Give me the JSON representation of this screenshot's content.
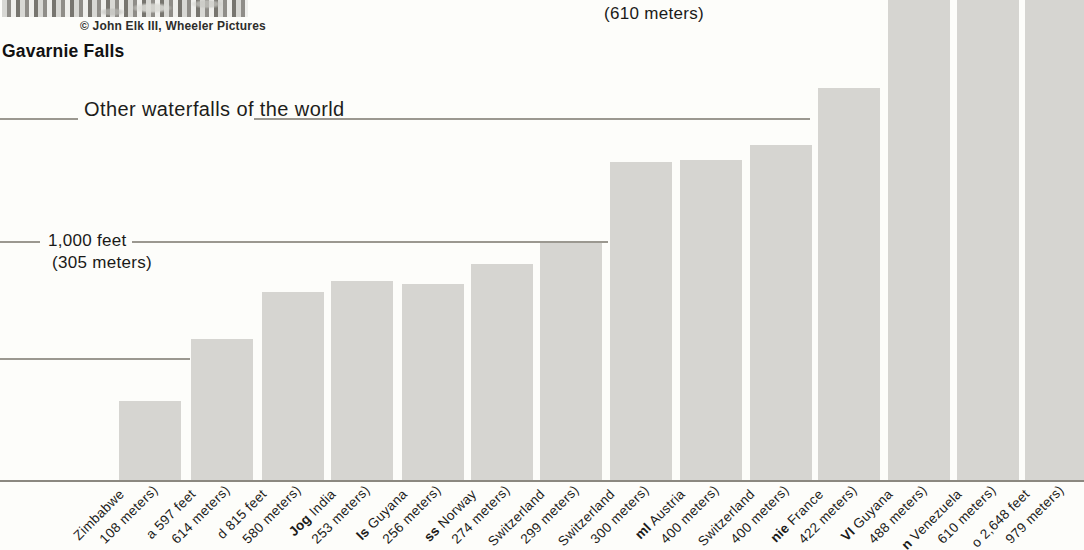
{
  "photo": {
    "caption": "© John Elk III, Wheeler Pictures",
    "title": "Gavarnie Falls"
  },
  "header": {
    "label": "Other waterfalls of the world"
  },
  "axis": {
    "gridline_2000ft_meters_label": "(610 meters)",
    "gridline_1000ft_feet_label": "1,000 feet",
    "gridline_1000ft_meters_label": "(305 meters)"
  },
  "colors": {
    "bar_fill": "#d6d5d1",
    "grid_line": "#9b9890",
    "baseline": "#8b8880",
    "text": "#1b1b19",
    "background": "#fdfdfa"
  },
  "geometry": {
    "baseline_y": 480,
    "gridline_1000ft_y": 241,
    "gridline_500ft_y": 358,
    "header_rule_y": 118,
    "bar_width": 62,
    "label1_dx": 8,
    "label1_y": 497,
    "label2_dx": 42,
    "label2_y": 493
  },
  "bars": [
    {
      "left": 119,
      "top": 401,
      "name_bold": "",
      "name_frag": "Zimbabwe",
      "meters_frag": "108 meters)"
    },
    {
      "left": 191,
      "top": 339,
      "name_bold": "",
      "name_frag": "a 597 feet",
      "meters_frag": "614 meters)"
    },
    {
      "left": 262,
      "top": 292,
      "name_bold": "",
      "name_frag": "d 815 feet",
      "meters_frag": "580 meters)"
    },
    {
      "left": 331,
      "top": 281,
      "name_bold": "Jog",
      "name_frag": " India",
      "meters_frag": "253 meters)"
    },
    {
      "left": 402,
      "top": 284,
      "name_bold": "ls",
      "name_frag": " Guyana",
      "meters_frag": "256 meters)"
    },
    {
      "left": 471,
      "top": 264,
      "name_bold": "ss",
      "name_frag": " Norway",
      "meters_frag": "274 meters)"
    },
    {
      "left": 540,
      "top": 242,
      "name_bold": "",
      "name_frag": "Switzerland",
      "meters_frag": "299 meters)"
    },
    {
      "left": 610,
      "top": 162,
      "name_bold": "",
      "name_frag": "Switzerland",
      "meters_frag": "300 meters)"
    },
    {
      "left": 680,
      "top": 160,
      "name_bold": "ml",
      "name_frag": " Austria",
      "meters_frag": "400 meters)"
    },
    {
      "left": 750,
      "top": 145,
      "name_bold": "",
      "name_frag": "Switzerland",
      "meters_frag": "400 meters)"
    },
    {
      "left": 818,
      "top": 88,
      "name_bold": "nie",
      "name_frag": " France",
      "meters_frag": "422 meters)"
    },
    {
      "left": 888,
      "top": 0,
      "name_bold": "VI",
      "name_frag": " Guyana",
      "meters_frag": "488 meters)"
    },
    {
      "left": 957,
      "top": 0,
      "name_bold": "n",
      "name_frag": " Venezuela",
      "meters_frag": "610 meters)"
    },
    {
      "left": 1025,
      "top": 0,
      "name_bold": "",
      "name_frag": "o 2,648 feet",
      "meters_frag": "979 meters)"
    }
  ],
  "chart_data": {
    "type": "bar",
    "title": "Other waterfalls of the world",
    "ylabel": "height",
    "unit": "feet",
    "ylim_visible": [
      0,
      2000
    ],
    "gridlines": [
      {
        "feet": 500,
        "label": ""
      },
      {
        "feet": 1000,
        "label": "1,000 feet (305 meters)"
      },
      {
        "feet": 2000,
        "label": "(610 meters)"
      }
    ],
    "categories": [
      "… Zimbabwe (108 meters)",
      "…a 597 feet (…614 meters)",
      "…d 815 feet (…580 meters)",
      "Jog India (…253 meters)",
      "…ls Guyana (…256 meters)",
      "…ss Norway (…274 meters)",
      "… Switzerland (…299 meters)",
      "… Switzerland (…300 meters)",
      "…ml Austria (…400 meters)",
      "… Switzerland (…400 meters)",
      "…nie France (…422 meters)",
      "…VI Guyana (…488 meters)",
      "…n Venezuela (…610 meters)",
      "…o 2,648 feet (…979 meters)"
    ],
    "values_feet_estimated": [
      333,
      592,
      788,
      833,
      821,
      904,
      996,
      1329,
      1338,
      1400,
      1638,
      2000,
      2000,
      2000
    ],
    "bars_cut_off_at_top": [
      false,
      false,
      false,
      false,
      false,
      false,
      false,
      false,
      false,
      false,
      false,
      true,
      true,
      true
    ],
    "legend": "none"
  }
}
